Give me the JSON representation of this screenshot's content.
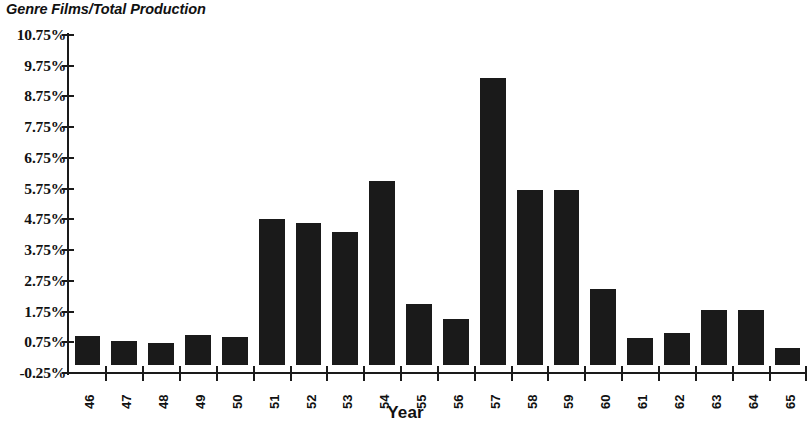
{
  "chart_data": {
    "type": "bar",
    "title": "Genre Films/Total Production",
    "xlabel": "Year",
    "ylabel": "",
    "categories": [
      "46",
      "47",
      "48",
      "49",
      "50",
      "51",
      "52",
      "53",
      "54",
      "55",
      "56",
      "57",
      "58",
      "59",
      "60",
      "61",
      "62",
      "63",
      "64",
      "65"
    ],
    "values": [
      0.95,
      0.8,
      0.72,
      0.98,
      0.92,
      4.75,
      4.62,
      4.33,
      6.0,
      2.0,
      1.5,
      9.35,
      5.7,
      5.7,
      2.5,
      0.88,
      1.05,
      1.8,
      1.8,
      0.58
    ],
    "value_labels": [
      "0.95%",
      "0.80%",
      "0.72%",
      "0.98%",
      "0.92%",
      "4.75%",
      "4.62%",
      "4.33%",
      "6.00%",
      "2.00%",
      "1.50%",
      "9.35%",
      "5.70%",
      "5.70%",
      "2.50%",
      "0.88%",
      "1.05%",
      "1.80%",
      "1.80%",
      "0.58%"
    ],
    "ylim": [
      -0.25,
      10.75
    ],
    "ytick_values": [
      -0.25,
      0.75,
      1.75,
      2.75,
      3.75,
      4.75,
      5.75,
      6.75,
      7.75,
      8.75,
      9.75,
      10.75
    ],
    "ytick_labels": [
      "-0.25%",
      "0.75%",
      "1.75%",
      "2.75%",
      "3.75%",
      "4.75%",
      "5.75%",
      "6.75%",
      "7.75%",
      "8.75%",
      "9.75%",
      "10.75%"
    ],
    "grid": false,
    "legend": null,
    "bar_color": "#1a1a1a",
    "axis_color": "#1a1a1a",
    "background": "#ffffff"
  }
}
